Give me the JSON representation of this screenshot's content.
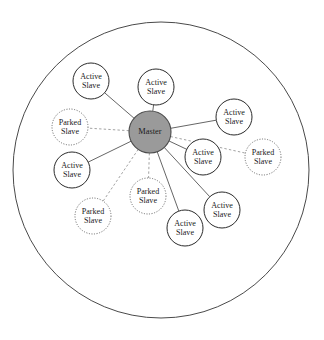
{
  "diagram": {
    "boundary": {
      "name": "piconet-boundary",
      "cx": 161,
      "cy": 170,
      "r": 148
    },
    "colors": {
      "master_fill": "#9a9a9a",
      "master_stroke": "#4a4a4a",
      "slave_fill": "#ffffff",
      "active_stroke": "#2b2b2b",
      "parked_stroke": "#6f6f6f",
      "solid_edge": "#555555",
      "dashed_edge": "#8a8a8a",
      "text": "#1a1a1a"
    },
    "master": {
      "id": "master",
      "label": "Master",
      "type": "master",
      "cx": 150,
      "cy": 132,
      "r": 21
    },
    "nodes": [
      {
        "id": "active-slave-1",
        "type": "active",
        "line1": "Active",
        "line2": "Slave",
        "cx": 91,
        "cy": 81,
        "r": 18,
        "link": "solid"
      },
      {
        "id": "active-slave-2",
        "type": "active",
        "line1": "Active",
        "line2": "Slave",
        "cx": 156,
        "cy": 87,
        "r": 18,
        "link": "solid"
      },
      {
        "id": "active-slave-3",
        "type": "active",
        "line1": "Active",
        "line2": "Slave",
        "cx": 234,
        "cy": 117,
        "r": 18,
        "link": "solid"
      },
      {
        "id": "active-slave-4",
        "type": "active",
        "line1": "Active",
        "line2": "Slave",
        "cx": 203,
        "cy": 157,
        "r": 18,
        "link": "solid"
      },
      {
        "id": "active-slave-5",
        "type": "active",
        "line1": "Active",
        "line2": "Slave",
        "cx": 72,
        "cy": 170,
        "r": 18,
        "link": "solid"
      },
      {
        "id": "active-slave-6",
        "type": "active",
        "line1": "Active",
        "line2": "Slave",
        "cx": 222,
        "cy": 210,
        "r": 18,
        "link": "solid"
      },
      {
        "id": "active-slave-7",
        "type": "active",
        "line1": "Active",
        "line2": "Slave",
        "cx": 185,
        "cy": 228,
        "r": 18,
        "link": "solid"
      },
      {
        "id": "parked-slave-1",
        "type": "parked",
        "line1": "Parked",
        "line2": "Slave",
        "cx": 70,
        "cy": 127,
        "r": 18,
        "link": "dashed"
      },
      {
        "id": "parked-slave-2",
        "type": "parked",
        "line1": "Parked",
        "line2": "Slave",
        "cx": 263,
        "cy": 157,
        "r": 18,
        "link": "dashed"
      },
      {
        "id": "parked-slave-3",
        "type": "parked",
        "line1": "Parked",
        "line2": "Slave",
        "cx": 93,
        "cy": 216,
        "r": 18,
        "link": "dashed"
      },
      {
        "id": "parked-slave-4",
        "type": "parked",
        "line1": "Parked",
        "line2": "Slave",
        "cx": 148,
        "cy": 196,
        "r": 18,
        "link": "dashed"
      }
    ],
    "legend_counts": {
      "active_slaves": 7,
      "parked_slaves": 4,
      "masters": 1
    }
  }
}
